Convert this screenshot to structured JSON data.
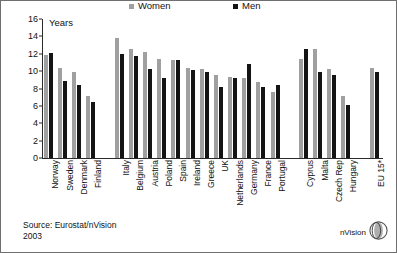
{
  "chart_data": {
    "type": "bar",
    "title": "",
    "xlabel": "",
    "ylabel": "Years",
    "ylim": [
      0,
      16
    ],
    "yticks": [
      0,
      2,
      4,
      6,
      8,
      10,
      12,
      14,
      16
    ],
    "grid": false,
    "legend_position": "top-center",
    "categories": [
      "Norway",
      "Sweden",
      "Denmark",
      "Finland",
      "Italy",
      "Belgium",
      "Austria",
      "Poland",
      "Spain",
      "Ireland",
      "Greece",
      "UK",
      "Netherlands",
      "Germany",
      "France",
      "Portugal",
      "Cyprus",
      "Malta",
      "Czech Rep",
      "Hungary",
      "EU 15*"
    ],
    "group_breaks_after": [
      "Finland",
      "Portugal",
      "Hungary"
    ],
    "series": [
      {
        "name": "Women",
        "color": "#a0a0a0",
        "values": [
          11.9,
          10.4,
          9.9,
          7.1,
          13.8,
          12.5,
          12.2,
          11.4,
          11.3,
          10.4,
          10.2,
          9.6,
          9.35,
          9.2,
          8.8,
          7.6,
          11.45,
          12.6,
          10.2,
          7.1,
          10.4
        ]
      },
      {
        "name": "Men",
        "color": "#141414",
        "values": [
          12.1,
          8.9,
          8.4,
          6.5,
          11.95,
          11.7,
          10.2,
          9.2,
          11.3,
          10.1,
          9.9,
          8.2,
          9.2,
          10.8,
          8.2,
          8.35,
          12.6,
          9.9,
          9.5,
          6.05,
          9.9
        ]
      }
    ]
  },
  "legend": {
    "items": [
      {
        "label": "Women",
        "color": "#a0a0a0"
      },
      {
        "label": "Men",
        "color": "#141414"
      }
    ]
  },
  "axis": {
    "y_title": "Years"
  },
  "footer": {
    "source": "Source: Eurostat/nVision",
    "year": "2003"
  },
  "brand": {
    "name": "nVision",
    "logo_icon": "sphere-logo-icon"
  }
}
